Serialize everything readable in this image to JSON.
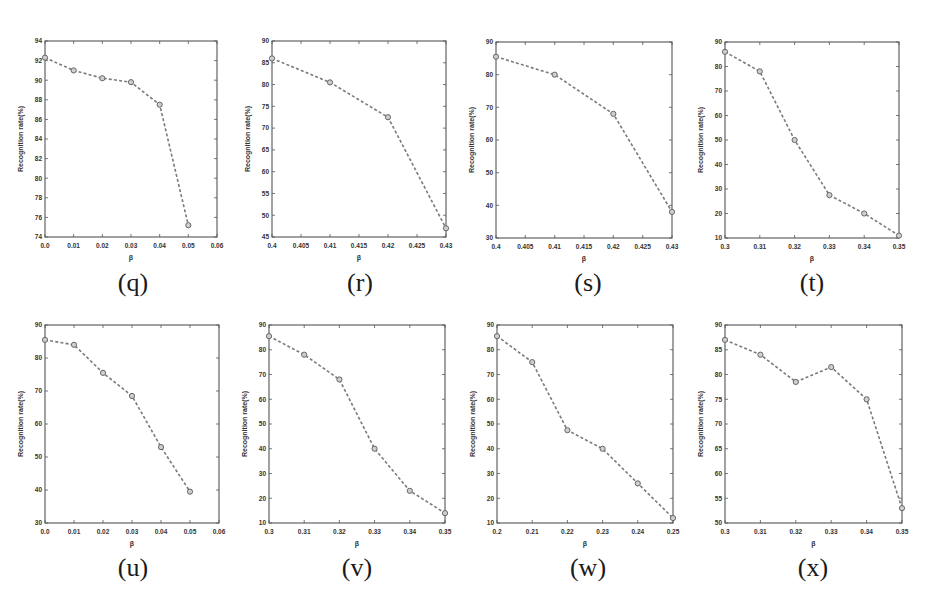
{
  "figure": {
    "line_color": "#7a7a7a",
    "marker_color": "#666666",
    "axis_color": "#555555"
  },
  "chart_data": [
    {
      "id": "q",
      "caption": "(q)",
      "type": "line",
      "xlabel": "β",
      "ylabel": "Recognition rate(%)",
      "xlim": [
        0,
        0.06
      ],
      "ylim": [
        74,
        94
      ],
      "xticks": [
        0,
        0.01,
        0.02,
        0.03,
        0.04,
        0.05,
        0.06
      ],
      "xtick_labels": [
        "0.0",
        "0.01",
        "0.02",
        "0.03",
        "0.04",
        "0.05",
        "0.06"
      ],
      "yticks": [
        74,
        76,
        78,
        80,
        82,
        84,
        86,
        88,
        90,
        92,
        94
      ],
      "x": [
        0,
        0.01,
        0.02,
        0.03,
        0.04,
        0.05
      ],
      "y": [
        92.3,
        91.0,
        90.2,
        89.8,
        87.5,
        75.2
      ],
      "box": {
        "left": 45,
        "top": 41,
        "right": 217,
        "bottom": 237
      },
      "caption_pos": {
        "x": 133,
        "y": 268
      }
    },
    {
      "id": "r",
      "caption": "(r)",
      "type": "line",
      "xlabel": "β",
      "ylabel": "Recognition rate(%)",
      "xlim": [
        0.4,
        0.43
      ],
      "ylim": [
        45,
        90
      ],
      "xticks": [
        0.4,
        0.405,
        0.41,
        0.415,
        0.42,
        0.425,
        0.43
      ],
      "xtick_labels": [
        "0.4",
        "0.405",
        "0.41",
        "0.415",
        "0.42",
        "0.425",
        "0.43"
      ],
      "yticks": [
        45,
        50,
        55,
        60,
        65,
        70,
        75,
        80,
        85,
        90
      ],
      "x": [
        0.4,
        0.41,
        0.42,
        0.43
      ],
      "y": [
        86.0,
        80.5,
        72.5,
        47.0
      ],
      "box": {
        "left": 272,
        "top": 41,
        "right": 446,
        "bottom": 237
      },
      "caption_pos": {
        "x": 360,
        "y": 268
      }
    },
    {
      "id": "s",
      "caption": "(s)",
      "type": "line",
      "xlabel": "β",
      "ylabel": "Recognition rate(%)",
      "xlim": [
        0.4,
        0.43
      ],
      "ylim": [
        30,
        90
      ],
      "xticks": [
        0.4,
        0.405,
        0.41,
        0.415,
        0.42,
        0.425,
        0.43
      ],
      "xtick_labels": [
        "0.4",
        "0.405",
        "0.41",
        "0.415",
        "0.42",
        "0.425",
        "0.43"
      ],
      "yticks": [
        30,
        40,
        50,
        60,
        70,
        80,
        90
      ],
      "x": [
        0.4,
        0.41,
        0.42,
        0.43
      ],
      "y": [
        85.5,
        80.0,
        68.0,
        38.0
      ],
      "box": {
        "left": 496,
        "top": 42,
        "right": 672,
        "bottom": 238
      },
      "caption_pos": {
        "x": 588,
        "y": 268
      }
    },
    {
      "id": "t",
      "caption": "(t)",
      "type": "line",
      "xlabel": "β",
      "ylabel": "Recognition rate(%)",
      "xlim": [
        0.3,
        0.35
      ],
      "ylim": [
        10,
        90
      ],
      "xticks": [
        0.3,
        0.31,
        0.32,
        0.33,
        0.34,
        0.35
      ],
      "xtick_labels": [
        "0.3",
        "0.31",
        "0.32",
        "0.33",
        "0.34",
        "0.35"
      ],
      "yticks": [
        10,
        20,
        30,
        40,
        50,
        60,
        70,
        80,
        90
      ],
      "x": [
        0.3,
        0.31,
        0.32,
        0.33,
        0.34,
        0.35
      ],
      "y": [
        86.0,
        78.0,
        50.0,
        27.5,
        20.0,
        11.0
      ],
      "box": {
        "left": 725,
        "top": 42,
        "right": 899,
        "bottom": 238
      },
      "caption_pos": {
        "x": 812,
        "y": 268
      }
    },
    {
      "id": "u",
      "caption": "(u)",
      "type": "line",
      "xlabel": "β",
      "ylabel": "Recognition rate(%)",
      "xlim": [
        0,
        0.06
      ],
      "ylim": [
        30,
        90
      ],
      "xticks": [
        0,
        0.01,
        0.02,
        0.03,
        0.04,
        0.05,
        0.06
      ],
      "xtick_labels": [
        "0.0",
        "0.01",
        "0.02",
        "0.03",
        "0.04",
        "0.05",
        "0.06"
      ],
      "yticks": [
        30,
        40,
        50,
        60,
        70,
        80,
        90
      ],
      "x": [
        0,
        0.01,
        0.02,
        0.03,
        0.04,
        0.05
      ],
      "y": [
        85.5,
        84.0,
        75.5,
        68.5,
        53.0,
        39.5
      ],
      "box": {
        "left": 45,
        "top": 325,
        "right": 219,
        "bottom": 523
      },
      "caption_pos": {
        "x": 133,
        "y": 553
      }
    },
    {
      "id": "v",
      "caption": "(v)",
      "type": "line",
      "xlabel": "β",
      "ylabel": "Recognition rate(%)",
      "xlim": [
        0.3,
        0.35
      ],
      "ylim": [
        10,
        90
      ],
      "xticks": [
        0.3,
        0.31,
        0.32,
        0.33,
        0.34,
        0.35
      ],
      "xtick_labels": [
        "0.3",
        "0.31",
        "0.32",
        "0.33",
        "0.34",
        "0.35"
      ],
      "yticks": [
        10,
        20,
        30,
        40,
        50,
        60,
        70,
        80,
        90
      ],
      "x": [
        0.3,
        0.31,
        0.32,
        0.33,
        0.34,
        0.35
      ],
      "y": [
        85.5,
        78.0,
        68.0,
        40.0,
        23.0,
        14.0
      ],
      "box": {
        "left": 269,
        "top": 325,
        "right": 445,
        "bottom": 523
      },
      "caption_pos": {
        "x": 357,
        "y": 553
      }
    },
    {
      "id": "w",
      "caption": "(w)",
      "type": "line",
      "xlabel": "β",
      "ylabel": "Recognition rate(%)",
      "xlim": [
        0.2,
        0.25
      ],
      "ylim": [
        10,
        90
      ],
      "xticks": [
        0.2,
        0.21,
        0.22,
        0.23,
        0.24,
        0.25
      ],
      "xtick_labels": [
        "0.2",
        "0.21",
        "0.22",
        "0.23",
        "0.24",
        "0.25"
      ],
      "yticks": [
        10,
        20,
        30,
        40,
        50,
        60,
        70,
        80,
        90
      ],
      "x": [
        0.2,
        0.21,
        0.22,
        0.23,
        0.24,
        0.25
      ],
      "y": [
        85.5,
        75.0,
        47.5,
        40.0,
        26.0,
        12.0
      ],
      "box": {
        "left": 497,
        "top": 325,
        "right": 673,
        "bottom": 523
      },
      "caption_pos": {
        "x": 588,
        "y": 553
      }
    },
    {
      "id": "x",
      "caption": "(x)",
      "type": "line",
      "xlabel": "β",
      "ylabel": "Recognition rate(%)",
      "xlim": [
        0.3,
        0.35
      ],
      "ylim": [
        50,
        90
      ],
      "xticks": [
        0.3,
        0.31,
        0.32,
        0.33,
        0.34,
        0.35
      ],
      "xtick_labels": [
        "0.3",
        "0.31",
        "0.32",
        "0.33",
        "0.34",
        "0.35"
      ],
      "yticks": [
        50,
        55,
        60,
        65,
        70,
        75,
        80,
        85,
        90
      ],
      "x": [
        0.3,
        0.31,
        0.32,
        0.33,
        0.34,
        0.35
      ],
      "y": [
        87.0,
        84.0,
        78.5,
        81.5,
        75.0,
        53.0
      ],
      "box": {
        "left": 725,
        "top": 325,
        "right": 902,
        "bottom": 523
      },
      "caption_pos": {
        "x": 813,
        "y": 553
      }
    }
  ]
}
